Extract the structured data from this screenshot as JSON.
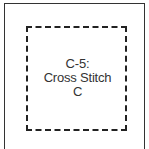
{
  "tile": {
    "code": "C-5:",
    "name": "Cross Stitch",
    "letter": "C"
  },
  "colors": {
    "frame": "#333333",
    "cut_line": "#222222",
    "text": "#333333",
    "background": "#ffffff"
  }
}
